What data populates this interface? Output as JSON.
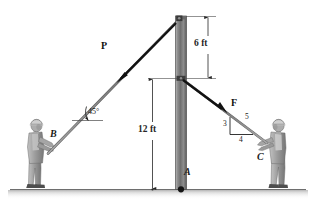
{
  "figure": {
    "background_color": "#ffffff",
    "ground_color": "#8c8c8c",
    "pole_color": "#8a8a8a",
    "rope_color": "#8c8c8c",
    "arrow_color": "#111111",
    "person_color": "#9a9a9a"
  },
  "labels": {
    "force_p": "P",
    "force_f": "F",
    "point_a": "A",
    "point_b": "B",
    "point_c": "C",
    "angle_45": "45°",
    "dim_6ft": "6 ft",
    "dim_12ft": "12 ft",
    "triangle_3": "3",
    "triangle_4": "4",
    "triangle_5": "5"
  },
  "dimensions": {
    "upper_segment": {
      "value": 6,
      "unit": "ft",
      "text": "6 ft"
    },
    "lower_segment": {
      "value": 12,
      "unit": "ft",
      "text": "12 ft"
    }
  },
  "geometry": {
    "pole_top_x": 181,
    "pole_top_y": 16,
    "pole_base_x": 181,
    "pole_base_y": 189,
    "attach_point_y": 78,
    "rope_b_angle_deg": 45,
    "rope_c_slope": {
      "rise": 3,
      "run": 4,
      "hyp": 5
    }
  },
  "icons": {
    "person_left": "person-icon",
    "person_right": "person-icon",
    "pin_support": "pin-support-icon"
  }
}
